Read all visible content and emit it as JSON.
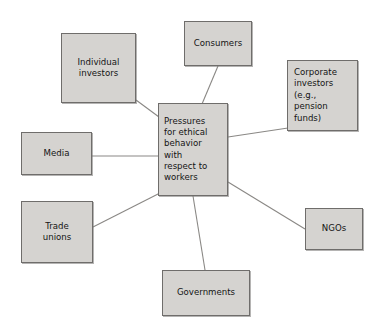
{
  "diagram": {
    "type": "hub-and-spoke concept map",
    "title_text": "Pressures for ethical behavior with respect to workers",
    "background_color": "#ffffff",
    "box_fill_color": "#d5d3d0",
    "box_border_color": "#6f6d6b",
    "connector_color": "#8a8885",
    "center": {
      "id": "center",
      "label": "Pressures\nfor ethical\nbehavior\nwith\nrespect to\nworkers",
      "x": 158,
      "y": 103,
      "width": 70,
      "height": 93
    },
    "nodes": [
      {
        "id": "individual-investors",
        "label": "Individual\ninvestors",
        "x": 61,
        "y": 33,
        "width": 75,
        "height": 70,
        "align": "center"
      },
      {
        "id": "consumers",
        "label": "Consumers",
        "x": 184,
        "y": 21,
        "width": 68,
        "height": 45,
        "align": "center"
      },
      {
        "id": "corporate-investors",
        "label": "Corporate\ninvestors\n(e.g.,\npension\nfunds)",
        "x": 287,
        "y": 60,
        "width": 71,
        "height": 71,
        "align": "left"
      },
      {
        "id": "media",
        "label": "Media",
        "x": 21,
        "y": 132,
        "width": 71,
        "height": 43,
        "align": "center"
      },
      {
        "id": "trade-unions",
        "label": "Trade\nunions",
        "x": 21,
        "y": 201,
        "width": 72,
        "height": 62,
        "align": "center"
      },
      {
        "id": "ngos",
        "label": "NGOs",
        "x": 305,
        "y": 208,
        "width": 58,
        "height": 42,
        "align": "center"
      },
      {
        "id": "governments",
        "label": "Governments",
        "x": 162,
        "y": 270,
        "width": 88,
        "height": 46,
        "align": "center"
      }
    ],
    "connectors": [
      {
        "id": "link-individual-investors",
        "from": "individual-investors",
        "to": "center",
        "x1": 136,
        "y1": 100,
        "x2": 159,
        "y2": 117
      },
      {
        "id": "link-consumers",
        "from": "consumers",
        "to": "center",
        "x1": 218,
        "y1": 66,
        "x2": 202,
        "y2": 104
      },
      {
        "id": "link-corporate-investors",
        "from": "center",
        "to": "corporate-investors",
        "x1": 228,
        "y1": 137,
        "x2": 288,
        "y2": 128
      },
      {
        "id": "link-media",
        "from": "media",
        "to": "center",
        "x1": 92,
        "y1": 156,
        "x2": 158,
        "y2": 156
      },
      {
        "id": "link-trade-unions",
        "from": "trade-unions",
        "to": "center",
        "x1": 93,
        "y1": 227,
        "x2": 160,
        "y2": 193
      },
      {
        "id": "link-ngos",
        "from": "center",
        "to": "ngos",
        "x1": 228,
        "y1": 182,
        "x2": 305,
        "y2": 229
      },
      {
        "id": "link-governments",
        "from": "center",
        "to": "governments",
        "x1": 193,
        "y1": 196,
        "x2": 205,
        "y2": 270
      }
    ]
  }
}
